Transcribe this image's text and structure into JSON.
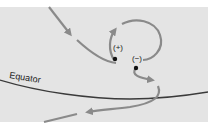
{
  "diagram": {
    "labels": {
      "equator": "Equator",
      "positive": "(+)",
      "negative": "(−)"
    },
    "colors": {
      "background": "#e4e4e4",
      "path": "#8a8a8a",
      "equator_line": "#3a3a3a",
      "charge_dot": "#111111"
    }
  }
}
